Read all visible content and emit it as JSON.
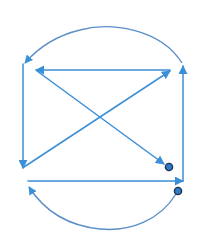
{
  "diagram": {
    "colors": {
      "line": "#3a8fd6",
      "arc": "#5b8ec7",
      "node_fill": "#2e7cc8",
      "node_stroke": "#1d3247",
      "background": "#ffffff"
    },
    "edges": [
      {
        "id": "top-arc",
        "type": "curve",
        "from": [
          182,
          63
        ],
        "ctrl": [
          140,
          10,
          24,
          64
        ],
        "to": [
          24,
          64
        ],
        "arrow": "end"
      },
      {
        "id": "left-vertical",
        "type": "line",
        "from": [
          23,
          64
        ],
        "to": [
          23,
          168
        ],
        "arrow": "end"
      },
      {
        "id": "top-horizontal",
        "type": "line",
        "from": [
          170,
          70
        ],
        "to": [
          36,
          70
        ],
        "arrow": "end"
      },
      {
        "id": "diagonal-down",
        "type": "line",
        "from": [
          36,
          71
        ],
        "to": [
          164,
          163
        ],
        "arrow": "end"
      },
      {
        "id": "diagonal-up",
        "type": "line",
        "from": [
          25,
          167
        ],
        "to": [
          170,
          71
        ],
        "arrow": "end"
      },
      {
        "id": "right-vertical",
        "type": "line",
        "from": [
          183,
          181
        ],
        "to": [
          183,
          66
        ],
        "arrow": "end"
      },
      {
        "id": "bottom-horizontal",
        "type": "line",
        "from": [
          28,
          181
        ],
        "to": [
          183,
          181
        ],
        "arrow": "end"
      },
      {
        "id": "bottom-arc",
        "type": "curve",
        "from": [
          177,
          194
        ],
        "to": [
          28,
          186
        ],
        "arrow": "end"
      }
    ],
    "nodes": [
      {
        "id": "node-1",
        "cx": 169,
        "cy": 168,
        "r": 3.5
      },
      {
        "id": "node-2",
        "cx": 178,
        "cy": 191,
        "r": 3.5
      }
    ]
  }
}
